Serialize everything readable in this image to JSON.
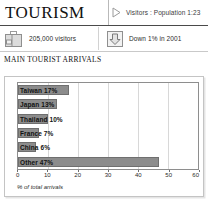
{
  "header": {
    "title": "TOURISM",
    "marker_icon": "triangle-right-icon",
    "caption": "Visitors : Population 1:23"
  },
  "stats": [
    {
      "icon": "suitcase-icon",
      "text": "205,000 visitors"
    },
    {
      "icon": "down-arrow-icon",
      "text": "Down 1% in 2001"
    }
  ],
  "section": {
    "title": "MAIN TOURIST ARRIVALS"
  },
  "chart_data": {
    "type": "bar",
    "orientation": "horizontal",
    "title": "MAIN TOURIST ARRIVALS",
    "xlabel": "% of total arrivals",
    "ylabel": "",
    "xlim": [
      0,
      60
    ],
    "ticks": [
      0,
      10,
      20,
      30,
      40,
      50,
      60
    ],
    "grid": true,
    "legend": "none",
    "categories": [
      "Taiwan",
      "Japan",
      "Thailand",
      "France",
      "China",
      "Other"
    ],
    "values": [
      17,
      13,
      10,
      7,
      6,
      47
    ],
    "labels": [
      "Taiwan 17%",
      "Japan 13%",
      "Thailand 10%",
      "France 7%",
      "China 6%",
      "Other 47%"
    ],
    "bar_color": "#8c8c8c",
    "bar_border_color": "#6f6f6f"
  }
}
